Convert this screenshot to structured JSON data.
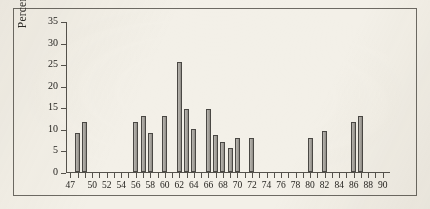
{
  "chart_data": {
    "type": "bar",
    "title": "",
    "xlabel": "",
    "ylabel": "Percentage of policy issues",
    "ylim": [
      0,
      35
    ],
    "ytick_labels": [
      "0",
      "5",
      "10",
      "15",
      "20",
      "25",
      "30",
      "35"
    ],
    "ytick_values": [
      0,
      5,
      10,
      15,
      20,
      25,
      30,
      35
    ],
    "xlim": [
      46.4,
      91
    ],
    "x_tick_years": [
      47,
      48,
      49,
      50,
      51,
      52,
      53,
      54,
      55,
      56,
      57,
      58,
      59,
      60,
      61,
      62,
      63,
      64,
      65,
      66,
      67,
      68,
      69,
      70,
      71,
      72,
      73,
      74,
      75,
      76,
      77,
      78,
      79,
      80,
      81,
      82,
      83,
      84,
      85,
      86,
      87,
      88,
      89,
      90
    ],
    "x_labeled_ticks": [
      {
        "year": 47,
        "label": "47"
      },
      {
        "year": 50,
        "label": "50"
      },
      {
        "year": 52,
        "label": "52"
      },
      {
        "year": 54,
        "label": "54"
      },
      {
        "year": 56,
        "label": "56"
      },
      {
        "year": 58,
        "label": "58"
      },
      {
        "year": 60,
        "label": "60"
      },
      {
        "year": 62,
        "label": "62"
      },
      {
        "year": 64,
        "label": "64"
      },
      {
        "year": 66,
        "label": "66"
      },
      {
        "year": 68,
        "label": "68"
      },
      {
        "year": 70,
        "label": "70"
      },
      {
        "year": 72,
        "label": "72"
      },
      {
        "year": 74,
        "label": "74"
      },
      {
        "year": 76,
        "label": "76"
      },
      {
        "year": 78,
        "label": "78"
      },
      {
        "year": 80,
        "label": "80"
      },
      {
        "year": 82,
        "label": "82"
      },
      {
        "year": 84,
        "label": "84"
      },
      {
        "year": 86,
        "label": "86"
      },
      {
        "year": 88,
        "label": "88"
      },
      {
        "year": 90,
        "label": "90"
      }
    ],
    "categories": [
      47,
      48,
      49,
      50,
      51,
      52,
      53,
      54,
      55,
      56,
      57,
      58,
      59,
      60,
      61,
      62,
      63,
      64,
      65,
      66,
      67,
      68,
      69,
      70,
      71,
      72,
      73,
      74,
      75,
      76,
      77,
      78,
      79,
      80,
      81,
      82,
      83,
      84,
      85,
      86,
      87,
      88,
      89,
      90
    ],
    "values": [
      0,
      9,
      11.5,
      0,
      0,
      0,
      0,
      0,
      0,
      11.5,
      13,
      9,
      0,
      13,
      0,
      25.5,
      14.5,
      10,
      0,
      14.5,
      8.5,
      7,
      5.5,
      8,
      0,
      8,
      0,
      0,
      0,
      0,
      0,
      0,
      0,
      8,
      0,
      9.5,
      0,
      0,
      0,
      11.5,
      13,
      0,
      0,
      0
    ],
    "bars": [
      {
        "year": 48,
        "value": 9
      },
      {
        "year": 49,
        "value": 11.5
      },
      {
        "year": 56,
        "value": 11.5
      },
      {
        "year": 57,
        "value": 13
      },
      {
        "year": 58,
        "value": 9
      },
      {
        "year": 60,
        "value": 13
      },
      {
        "year": 62,
        "value": 25.5
      },
      {
        "year": 63,
        "value": 14.5
      },
      {
        "year": 64,
        "value": 10
      },
      {
        "year": 66,
        "value": 14.5
      },
      {
        "year": 67,
        "value": 8.5
      },
      {
        "year": 68,
        "value": 7
      },
      {
        "year": 69,
        "value": 5.5
      },
      {
        "year": 70,
        "value": 8
      },
      {
        "year": 72,
        "value": 8
      },
      {
        "year": 80,
        "value": 8
      },
      {
        "year": 82,
        "value": 9.5
      },
      {
        "year": 86,
        "value": 11.5
      },
      {
        "year": 87,
        "value": 13
      }
    ],
    "grid": false,
    "legend": null,
    "colors": {
      "bar_fill": "#a8a59f",
      "bar_stroke": "#4a4844",
      "axis": "#55524c",
      "text": "#25231f",
      "background": "#f3f0e8",
      "frame": "#6d6a63"
    }
  }
}
